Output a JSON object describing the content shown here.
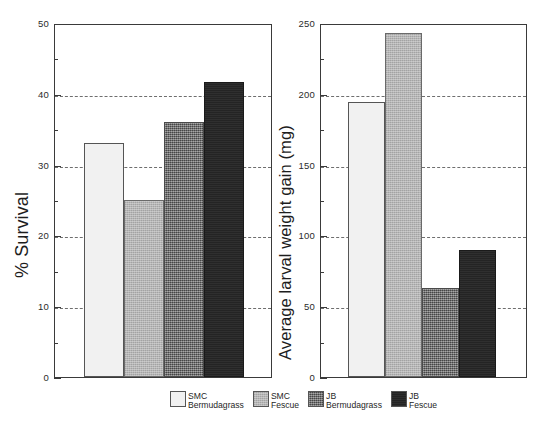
{
  "chart_data": [
    {
      "type": "bar",
      "panel": "left",
      "title": "",
      "xlabel": "",
      "ylabel": "% Survival",
      "ylim": [
        0,
        50
      ],
      "yticks": [
        0,
        10,
        20,
        30,
        40,
        50
      ],
      "ytick_labels": [
        "0",
        "10",
        "20",
        "30",
        "40",
        "50"
      ],
      "minor_tick_step": 5,
      "grid": true,
      "grid_axis": "y",
      "grid_style": "dashed",
      "categories": [
        "SMC Bermudagrass",
        "SMC Fescue",
        "JB Bermudagrass",
        "JB Fescue"
      ],
      "values": [
        33,
        25,
        36,
        41.7
      ],
      "xticks_visible": false
    },
    {
      "type": "bar",
      "panel": "right",
      "title": "",
      "xlabel": "",
      "ylabel": "Average larval weight gain (mg)",
      "ylim": [
        0,
        250
      ],
      "yticks": [
        0,
        50,
        100,
        150,
        200,
        250
      ],
      "ytick_labels": [
        "0",
        "50",
        "100",
        "150",
        "200",
        "250"
      ],
      "minor_tick_step": 25,
      "grid": true,
      "grid_axis": "y",
      "grid_style": "dashed",
      "categories": [
        "SMC Bermudagrass",
        "SMC Fescue",
        "JB Bermudagrass",
        "JB Fescue"
      ],
      "values": [
        194,
        243,
        63,
        90
      ],
      "xticks_visible": false
    }
  ],
  "legend": {
    "position": "bottom-center",
    "entries": [
      {
        "line1": "SMC",
        "line2": "Bermudagrass",
        "color": "#f1f1f1",
        "pattern": "solid-light"
      },
      {
        "line1": "SMC",
        "line2": "Fescue",
        "color": "#b5b5b5",
        "pattern": "medium-gray"
      },
      {
        "line1": "JB",
        "line2": "Bermudagrass",
        "color": "#6d6d6d",
        "pattern": "dark-speckle"
      },
      {
        "line1": "JB",
        "line2": "Fescue",
        "color": "#242424",
        "pattern": "solid-black"
      }
    ]
  },
  "colors": {
    "axis": "#3a3a3a",
    "grid": "#555555",
    "text": "#1a1a1a",
    "background": "#ffffff"
  }
}
